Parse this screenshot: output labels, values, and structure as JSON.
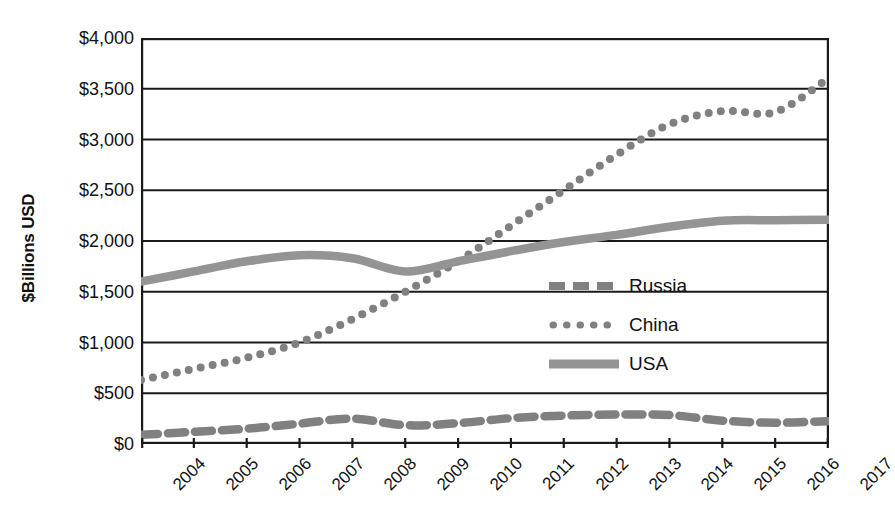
{
  "chart_data": {
    "type": "line",
    "title": "",
    "subtitle": "",
    "xlabel": "",
    "ylabel": "$Billions USD",
    "categories": [
      "2004",
      "2005",
      "2006",
      "2007",
      "2008",
      "2009",
      "2010",
      "2011",
      "2012",
      "2013",
      "2014",
      "2015",
      "2016",
      "2017"
    ],
    "x": [
      2004,
      2005,
      2006,
      2007,
      2008,
      2009,
      2010,
      2011,
      2012,
      2013,
      2014,
      2015,
      2016,
      2017
    ],
    "series": [
      {
        "name": "Russia",
        "style": "dashed",
        "color": "#808080",
        "values": [
          90,
          120,
          150,
          200,
          250,
          185,
          205,
          255,
          280,
          290,
          285,
          230,
          210,
          225
        ]
      },
      {
        "name": "China",
        "style": "dotted",
        "color": "#808080",
        "values": [
          630,
          740,
          850,
          1000,
          1230,
          1500,
          1800,
          2150,
          2500,
          2850,
          3150,
          3280,
          3270,
          3600
        ]
      },
      {
        "name": "USA",
        "style": "solid",
        "color": "#949494",
        "values": [
          1600,
          1700,
          1800,
          1860,
          1830,
          1700,
          1800,
          1900,
          1990,
          2060,
          2140,
          2200,
          2205,
          2210
        ]
      }
    ],
    "ylim": [
      0,
      4000
    ],
    "yticks": [
      0,
      500,
      1000,
      1500,
      2000,
      2500,
      3000,
      3500,
      4000
    ],
    "ytick_labels": [
      "$0",
      "$500",
      "$1,000",
      "$1,500",
      "$2,000",
      "$2,500",
      "$3,000",
      "$3,500",
      "$4,000"
    ],
    "grid": true,
    "grid_axis": "y",
    "legend_position": "center-right",
    "legend_entries": [
      "Russia",
      "China",
      "USA"
    ],
    "xtick_rotation": -45,
    "plot_border": true,
    "background": "#ffffff",
    "axis_color": "#1a1a1a"
  }
}
